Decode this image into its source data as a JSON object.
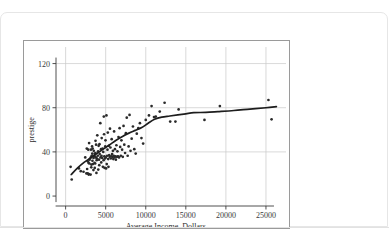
{
  "footer": {
    "note": ""
  },
  "chart_data": {
    "type": "scatter",
    "title": "",
    "xlabel": "Average Income, Dollars",
    "ylabel": "prestige",
    "xlim": [
      -1200,
      27500
    ],
    "ylim": [
      -9,
      135
    ],
    "xticks": [
      0,
      5000,
      10000,
      15000,
      20000,
      25000
    ],
    "xtick_labels": [
      "0",
      "5000",
      "10000",
      "15000",
      "20000",
      "25000"
    ],
    "yticks": [
      0,
      40,
      80,
      120
    ],
    "ytick_labels": [
      "0",
      "40",
      "80",
      "120"
    ],
    "grid": true,
    "legend": null,
    "series": [
      {
        "name": "occupations",
        "marker": "filled-circle",
        "color": "#2a2a2a",
        "points": [
          [
            625,
            26.5
          ],
          [
            761,
            15.0
          ],
          [
            1656,
            25.0
          ],
          [
            1890,
            22.5
          ],
          [
            2234,
            22.0
          ],
          [
            2448,
            35.0
          ],
          [
            2594,
            20.5
          ],
          [
            2642,
            43.0
          ],
          [
            2686,
            24.5
          ],
          [
            2753,
            20.5
          ],
          [
            2765,
            31.5
          ],
          [
            2829,
            42.0
          ],
          [
            2865,
            30.0
          ],
          [
            2881,
            19.5
          ],
          [
            2902,
            20.0
          ],
          [
            2930,
            48.0
          ],
          [
            2961,
            29.5
          ],
          [
            3000,
            33.0
          ],
          [
            3116,
            19.5
          ],
          [
            3148,
            35.0
          ],
          [
            3161,
            42.0
          ],
          [
            3200,
            26.0
          ],
          [
            3211,
            28.5
          ],
          [
            3249,
            36.5
          ],
          [
            3302,
            45.0
          ],
          [
            3332,
            38.5
          ],
          [
            3346,
            32.0
          ],
          [
            3374,
            43.0
          ],
          [
            3403,
            29.0
          ],
          [
            3472,
            23.5
          ],
          [
            3485,
            34.5
          ],
          [
            3511,
            41.0
          ],
          [
            3606,
            30.0
          ],
          [
            3617,
            36.0
          ],
          [
            3636,
            25.5
          ],
          [
            3650,
            38.0
          ],
          [
            3691,
            29.5
          ],
          [
            3714,
            39.0
          ],
          [
            3730,
            50.0
          ],
          [
            3779,
            35.0
          ],
          [
            3804,
            46.5
          ],
          [
            3845,
            21.0
          ],
          [
            3875,
            32.5
          ],
          [
            3905,
            34.0
          ],
          [
            3951,
            55.0
          ],
          [
            4012,
            36.5
          ],
          [
            4055,
            40.5
          ],
          [
            4075,
            24.0
          ],
          [
            4120,
            45.5
          ],
          [
            4168,
            33.0
          ],
          [
            4199,
            28.0
          ],
          [
            4224,
            47.0
          ],
          [
            4253,
            38.0
          ],
          [
            4330,
            66.0
          ],
          [
            4356,
            35.0
          ],
          [
            4414,
            42.5
          ],
          [
            4443,
            30.5
          ],
          [
            4471,
            36.5
          ],
          [
            4502,
            52.5
          ],
          [
            4556,
            34.5
          ],
          [
            4614,
            43.0
          ],
          [
            4648,
            26.5
          ],
          [
            4696,
            40.0
          ],
          [
            4741,
            32.5
          ],
          [
            4768,
            72.0
          ],
          [
            4798,
            56.0
          ],
          [
            4833,
            36.0
          ],
          [
            4866,
            25.5
          ],
          [
            4914,
            34.0
          ],
          [
            4947,
            45.0
          ],
          [
            4975,
            50.5
          ],
          [
            5011,
            35.0
          ],
          [
            5052,
            25.0
          ],
          [
            5095,
            73.0
          ],
          [
            5135,
            29.0
          ],
          [
            5180,
            36.5
          ],
          [
            5222,
            42.0
          ],
          [
            5263,
            57.5
          ],
          [
            5313,
            33.5
          ],
          [
            5347,
            26.5
          ],
          [
            5390,
            45.5
          ],
          [
            5439,
            37.0
          ],
          [
            5493,
            35.5
          ],
          [
            5536,
            61.0
          ],
          [
            5590,
            44.0
          ],
          [
            5640,
            34.0
          ],
          [
            5693,
            36.0
          ],
          [
            5746,
            51.5
          ],
          [
            5799,
            38.0
          ],
          [
            5848,
            35.5
          ],
          [
            5902,
            41.0
          ],
          [
            5951,
            33.5
          ],
          [
            6004,
            36.5
          ],
          [
            6051,
            58.5
          ],
          [
            6098,
            35.0
          ],
          [
            6155,
            42.5
          ],
          [
            6212,
            36.0
          ],
          [
            6270,
            33.0
          ],
          [
            6336,
            46.0
          ],
          [
            6403,
            35.5
          ],
          [
            6462,
            40.5
          ],
          [
            6534,
            36.0
          ],
          [
            6600,
            53.5
          ],
          [
            6666,
            35.0
          ],
          [
            6739,
            61.5
          ],
          [
            6810,
            44.5
          ],
          [
            6886,
            36.5
          ],
          [
            6963,
            50.5
          ],
          [
            7050,
            42.0
          ],
          [
            7133,
            35.5
          ],
          [
            7227,
            63.5
          ],
          [
            7320,
            46.5
          ],
          [
            7419,
            39.0
          ],
          [
            7519,
            57.0
          ],
          [
            7630,
            71.0
          ],
          [
            7743,
            36.5
          ],
          [
            7862,
            45.0
          ],
          [
            7975,
            73.5
          ],
          [
            8100,
            41.0
          ],
          [
            8240,
            52.0
          ],
          [
            8403,
            63.0
          ],
          [
            8568,
            42.5
          ],
          [
            8744,
            38.5
          ],
          [
            8880,
            56.5
          ],
          [
            9072,
            61.5
          ],
          [
            9271,
            66.0
          ],
          [
            9463,
            52.5
          ],
          [
            9675,
            47.5
          ],
          [
            10000,
            69.0
          ],
          [
            10400,
            73.0
          ],
          [
            10726,
            81.5
          ],
          [
            11030,
            71.5
          ],
          [
            11250,
            72.0
          ],
          [
            11746,
            76.5
          ],
          [
            12351,
            84.5
          ],
          [
            13050,
            67.5
          ],
          [
            13700,
            67.5
          ],
          [
            14100,
            78.5
          ],
          [
            17325,
            69.0
          ],
          [
            19248,
            81.5
          ],
          [
            25308,
            87.0
          ],
          [
            25700,
            69.5
          ]
        ]
      }
    ],
    "smoother": {
      "name": "lowess",
      "color": "#1d1d1d",
      "points": [
        [
          700,
          19.5
        ],
        [
          1500,
          25.5
        ],
        [
          2300,
          30.5
        ],
        [
          3100,
          34.5
        ],
        [
          3900,
          38.5
        ],
        [
          4700,
          42.5
        ],
        [
          5500,
          46.5
        ],
        [
          6300,
          50.5
        ],
        [
          7100,
          54.0
        ],
        [
          7900,
          57.0
        ],
        [
          8700,
          59.5
        ],
        [
          9500,
          62.0
        ],
        [
          10300,
          66.0
        ],
        [
          11100,
          69.5
        ],
        [
          12000,
          71.5
        ],
        [
          13000,
          72.5
        ],
        [
          14000,
          73.5
        ],
        [
          15000,
          74.5
        ],
        [
          16000,
          75.5
        ],
        [
          17500,
          75.8
        ],
        [
          19000,
          76.5
        ],
        [
          21000,
          77.5
        ],
        [
          23000,
          78.8
        ],
        [
          25000,
          80.0
        ],
        [
          26300,
          81.0
        ]
      ]
    }
  }
}
